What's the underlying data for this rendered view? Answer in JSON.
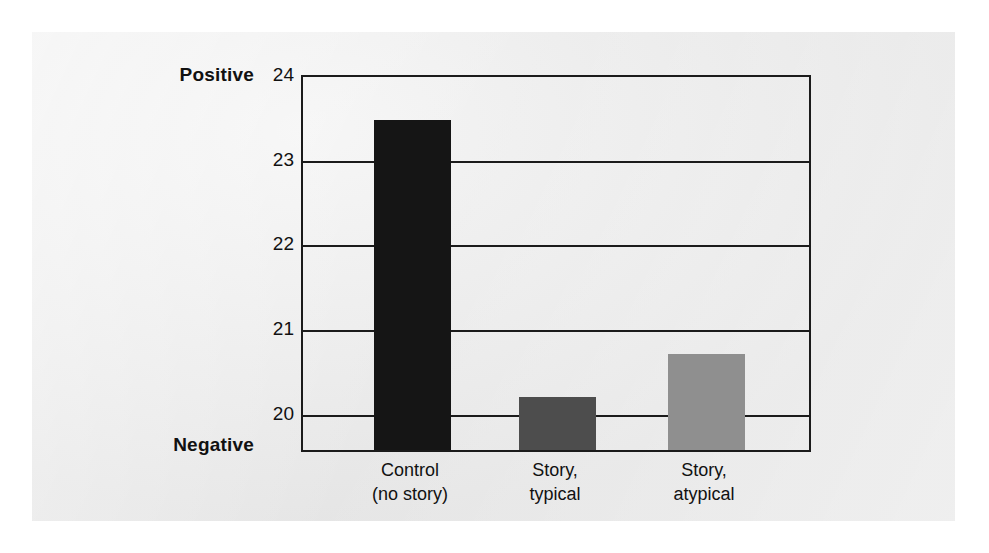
{
  "chart_data": {
    "type": "bar",
    "title": "",
    "subtitle": "",
    "xlabel": "",
    "ylabel": "",
    "categories": [
      "Control\n(no story)",
      "Story,\ntypical",
      "Story,\natypical"
    ],
    "category_lines": [
      [
        "Control",
        "(no story)"
      ],
      [
        "Story,",
        "typical"
      ],
      [
        "Story,",
        "atypical"
      ]
    ],
    "values": [
      23.45,
      20.18,
      20.68
    ],
    "bar_colors": [
      "#151515",
      "#4d4d4d",
      "#8f8f8f"
    ],
    "ylim": [
      19.55,
      24
    ],
    "yticks": [
      24,
      23,
      22,
      21,
      20
    ],
    "ytick_labels": [
      "24",
      "23",
      "22",
      "21",
      "20"
    ],
    "grid": "horizontal",
    "legend": "none",
    "axis_endpoint_labels": {
      "top": "Positive",
      "bottom": "Negative"
    },
    "annotations": []
  },
  "axis": {
    "positive_label": "Positive",
    "negative_label": "Negative"
  },
  "style": {
    "panel_background": "#e9e9e9",
    "axis_color": "#1b1b1b",
    "text_color": "#111111"
  }
}
